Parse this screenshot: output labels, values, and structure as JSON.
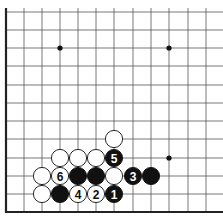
{
  "board": {
    "line_color": "#555555",
    "edge_color": "#222222",
    "star_points": [
      [
        3,
        9
      ],
      [
        9,
        9
      ],
      [
        9,
        3
      ]
    ],
    "columns_x": [
      6,
      24,
      42,
      60,
      78,
      96,
      114,
      133,
      151,
      169,
      188,
      206,
      224
    ],
    "rows_y_from_bottom": [
      212,
      194,
      176,
      158,
      139,
      121,
      103,
      85,
      66,
      48,
      30,
      12
    ]
  },
  "stones": [
    {
      "color": "white",
      "col": 2,
      "row": 1,
      "label": ""
    },
    {
      "color": "black",
      "col": 3,
      "row": 1,
      "label": ""
    },
    {
      "color": "white",
      "col": 4,
      "row": 1,
      "label": "4"
    },
    {
      "color": "white",
      "col": 5,
      "row": 1,
      "label": "2"
    },
    {
      "color": "black",
      "col": 6,
      "row": 1,
      "label": "1"
    },
    {
      "color": "white",
      "col": 2,
      "row": 2,
      "label": ""
    },
    {
      "color": "white",
      "col": 3,
      "row": 2,
      "label": "6"
    },
    {
      "color": "black",
      "col": 4,
      "row": 2,
      "label": ""
    },
    {
      "color": "black",
      "col": 5,
      "row": 2,
      "label": ""
    },
    {
      "color": "white",
      "col": 6,
      "row": 2,
      "label": ""
    },
    {
      "color": "black",
      "col": 7,
      "row": 2,
      "label": "3"
    },
    {
      "color": "black",
      "col": 8,
      "row": 2,
      "label": ""
    },
    {
      "color": "white",
      "col": 3,
      "row": 3,
      "label": ""
    },
    {
      "color": "white",
      "col": 4,
      "row": 3,
      "label": ""
    },
    {
      "color": "white",
      "col": 5,
      "row": 3,
      "label": ""
    },
    {
      "color": "black",
      "col": 6,
      "row": 3,
      "label": "5"
    },
    {
      "color": "white",
      "col": 6,
      "row": 4,
      "label": ""
    }
  ]
}
